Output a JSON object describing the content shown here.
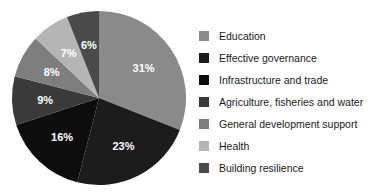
{
  "chart_data": {
    "type": "pie",
    "title": "",
    "subtitle": "",
    "xlabel": "",
    "ylabel": "",
    "legend_position": "right",
    "grid": false,
    "start_angle_deg": 0,
    "direction": "clockwise",
    "categories": [
      "Education",
      "Effective governance",
      "Infrastructure and trade",
      "Agriculture, fisheries and water",
      "General development support",
      "Health",
      "Building resilience"
    ],
    "values": [
      31,
      23,
      16,
      9,
      8,
      7,
      6
    ],
    "value_unit": "%",
    "data_labels": [
      "31%",
      "23%",
      "16%",
      "9%",
      "8%",
      "7%",
      "6%"
    ],
    "colors": [
      "#8a8a8a",
      "#1c1c1c",
      "#0d0d0d",
      "#3a3a3a",
      "#7e7e7e",
      "#b5b5b5",
      "#4a4a4a"
    ],
    "label_color": "#ffffff",
    "background": "#ffffff"
  },
  "legend": {
    "items": [
      {
        "label": "Education",
        "color": "#8a8a8a",
        "value": "31%"
      },
      {
        "label": "Effective governance",
        "color": "#1c1c1c",
        "value": "23%"
      },
      {
        "label": "Infrastructure and trade",
        "color": "#0d0d0d",
        "value": "16%"
      },
      {
        "label": "Agriculture, fisheries and water",
        "color": "#3a3a3a",
        "value": "9%"
      },
      {
        "label": "General development support",
        "color": "#7e7e7e",
        "value": "8%"
      },
      {
        "label": "Health",
        "color": "#b5b5b5",
        "value": "7%"
      },
      {
        "label": "Building resilience",
        "color": "#4a4a4a",
        "value": "6%"
      }
    ]
  }
}
